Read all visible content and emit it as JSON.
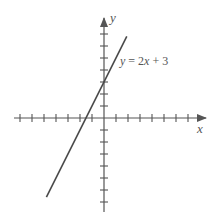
{
  "chart_data": {
    "type": "line",
    "title": "",
    "xlabel": "x",
    "ylabel": "y",
    "annotation": "y = 2x + 3",
    "xlim": [
      -7.5,
      8
    ],
    "ylim": [
      -7.5,
      8
    ],
    "x_ticks": [
      -7,
      -6,
      -5,
      -4,
      -3,
      -2,
      -1,
      1,
      2,
      3,
      4,
      5,
      6,
      7
    ],
    "y_ticks": [
      -7,
      -6,
      -5,
      -4,
      -3,
      -2,
      -1,
      1,
      2,
      3,
      4,
      5,
      6,
      7
    ],
    "tick_labels_shown": false,
    "grid": false,
    "legend": null,
    "series": [
      {
        "name": "y = 2x + 3",
        "equation": {
          "slope": 2,
          "intercept": 3
        },
        "x": [
          -4.8,
          -1.5,
          0,
          1.9
        ],
        "y": [
          -6.6,
          0,
          3,
          6.8
        ]
      }
    ]
  },
  "labels": {
    "x_axis": "x",
    "y_axis": "y",
    "equation_lhs": "y",
    "equation_mid": " = 2",
    "equation_var": "x",
    "equation_rhs": " + 3"
  },
  "colors": {
    "axes": "#555555",
    "line": "#4a4a4a",
    "text": "#555555",
    "background": "#ffffff"
  }
}
